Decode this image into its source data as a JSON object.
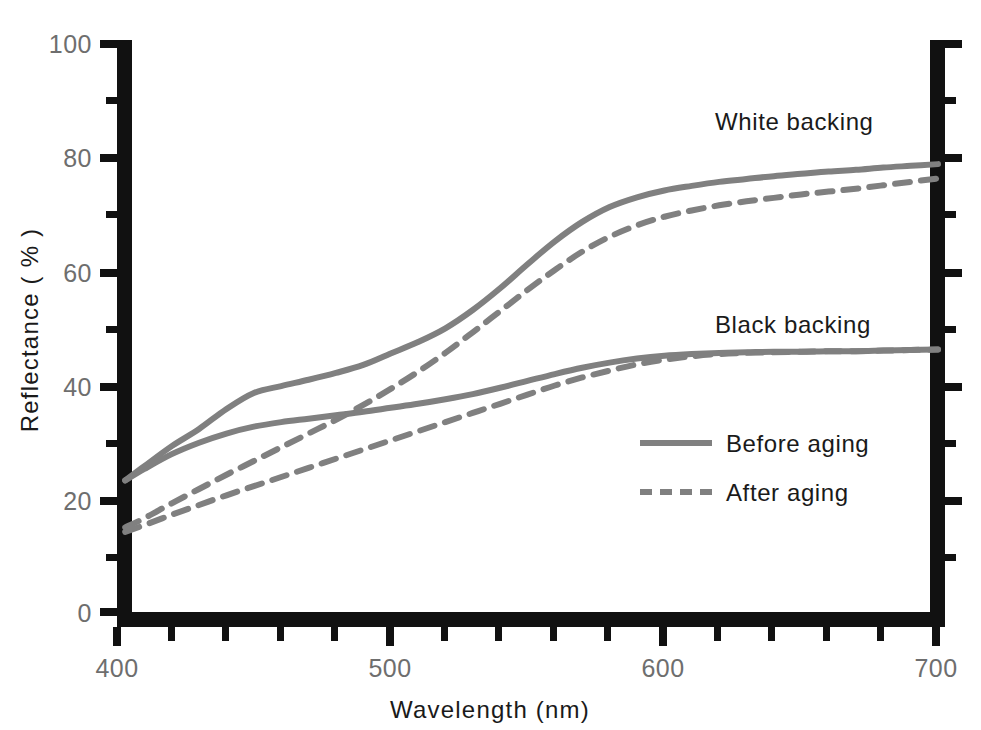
{
  "chart_data": {
    "type": "line",
    "title": "",
    "xlabel": "Wavelength (nm)",
    "ylabel": "Reflectance ( % )",
    "xlim": [
      400,
      700
    ],
    "ylim": [
      0,
      100
    ],
    "xticks": [
      400,
      500,
      600,
      700
    ],
    "xtick_labels": [
      "400",
      "500",
      "600",
      "700"
    ],
    "yticks": [
      0,
      20,
      40,
      60,
      80,
      100
    ],
    "ytick_labels": [
      "0",
      "20",
      "40",
      "60",
      "80",
      "100"
    ],
    "x_minor_tick_step": 20,
    "y_minor_tick_step": 10,
    "grid": false,
    "legend_position": "center-right-inside",
    "line_color": "#808080",
    "axis_color": "#111111",
    "text_color": "#1a1a1a",
    "tick_label_color": "#6e6e6e",
    "annotations": [
      {
        "text": "White backing",
        "x": 628,
        "y": 82
      },
      {
        "text": "Black backing",
        "x": 628,
        "y": 51
      }
    ],
    "legend": [
      {
        "label": "Before aging",
        "style": "solid"
      },
      {
        "label": "After aging",
        "style": "dashed"
      }
    ],
    "x": [
      403,
      410,
      420,
      430,
      440,
      450,
      460,
      470,
      480,
      490,
      500,
      510,
      520,
      530,
      540,
      550,
      560,
      570,
      580,
      590,
      600,
      610,
      620,
      630,
      640,
      650,
      660,
      670,
      680,
      690,
      700
    ],
    "series": [
      {
        "name": "White backing — Before aging",
        "backing": "white",
        "condition": "Before aging",
        "style": "solid",
        "values": [
          23.0,
          25.5,
          29.0,
          32.0,
          35.5,
          38.3,
          39.5,
          40.6,
          41.8,
          43.2,
          45.2,
          47.2,
          49.6,
          52.8,
          56.6,
          60.8,
          64.8,
          68.2,
          70.8,
          72.5,
          73.7,
          74.5,
          75.2,
          75.7,
          76.2,
          76.6,
          77.0,
          77.3,
          77.7,
          78.0,
          78.3
        ]
      },
      {
        "name": "White backing — After aging",
        "backing": "white",
        "condition": "After aging",
        "style": "dashed",
        "values": [
          14.8,
          16.4,
          19.0,
          21.5,
          24.0,
          26.4,
          28.8,
          31.2,
          33.6,
          36.2,
          39.0,
          42.0,
          45.3,
          48.9,
          52.6,
          56.3,
          59.8,
          63.0,
          65.6,
          67.6,
          69.1,
          70.2,
          71.1,
          71.8,
          72.4,
          73.0,
          73.5,
          74.0,
          74.6,
          75.2,
          75.8
        ]
      },
      {
        "name": "Black backing — Before aging",
        "backing": "black",
        "condition": "Before aging",
        "style": "solid",
        "values": [
          23.0,
          25.0,
          27.6,
          29.6,
          31.2,
          32.4,
          33.2,
          33.8,
          34.4,
          35.0,
          35.7,
          36.4,
          37.2,
          38.1,
          39.2,
          40.4,
          41.6,
          42.7,
          43.6,
          44.3,
          44.8,
          45.1,
          45.3,
          45.4,
          45.5,
          45.5,
          45.6,
          45.6,
          45.7,
          45.8,
          45.9
        ]
      },
      {
        "name": "Black backing — After aging",
        "backing": "black",
        "condition": "After aging",
        "style": "dashed",
        "values": [
          14.0,
          15.2,
          17.0,
          18.7,
          20.4,
          22.0,
          23.6,
          25.2,
          26.8,
          28.4,
          30.0,
          31.6,
          33.2,
          34.8,
          36.4,
          38.0,
          39.6,
          41.0,
          42.2,
          43.3,
          44.1,
          44.7,
          45.1,
          45.3,
          45.4,
          45.5,
          45.6,
          45.6,
          45.7,
          45.8,
          45.9
        ]
      }
    ]
  },
  "geometry": {
    "plot_left_px": 117,
    "plot_right_px": 938,
    "plot_top_px": 40,
    "plot_bottom_px": 612,
    "axis_thickness_px": 15,
    "major_tick_len_px": 17,
    "minor_tick_len_px": 11
  },
  "legend_box": {
    "x": 640,
    "y": 448,
    "line_x1": 640,
    "line_x2": 710,
    "text_x": 724,
    "row1_y": 448,
    "row2_y": 497
  }
}
